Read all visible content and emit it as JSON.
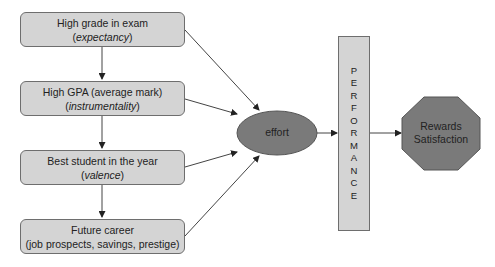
{
  "diagram": {
    "type": "flow",
    "boxes": [
      {
        "title": "High grade in exam",
        "subtitle_open": "(",
        "subtitle_italic": "expectancy",
        "subtitle_close": ")"
      },
      {
        "title": "High GPA (average mark)",
        "subtitle_open": "(",
        "subtitle_italic": "instrumentality",
        "subtitle_close": ")"
      },
      {
        "title": "Best student in the year",
        "subtitle_open": "(",
        "subtitle_italic": "valence",
        "subtitle_close": ")"
      },
      {
        "title": "Future career",
        "subtitle_plain": "(job prospects, savings, prestige)"
      }
    ],
    "effort": {
      "label": "effort"
    },
    "performance": {
      "letters": [
        "P",
        "E",
        "R",
        "F",
        "O",
        "R",
        "M",
        "A",
        "N",
        "C",
        "E"
      ]
    },
    "reward": {
      "line1": "Rewards",
      "line2": "Satisfaction"
    },
    "colors": {
      "box_fill": "#d4d4d4",
      "dark_fill": "#7a7a7a",
      "stroke": "#6e6e6e",
      "arrow": "#333333"
    },
    "edges": [
      [
        "box-0",
        "box-1"
      ],
      [
        "box-1",
        "box-2"
      ],
      [
        "box-2",
        "box-3"
      ],
      [
        "box-0",
        "effort"
      ],
      [
        "box-1",
        "effort"
      ],
      [
        "box-2",
        "effort"
      ],
      [
        "box-3",
        "effort"
      ],
      [
        "effort",
        "performance"
      ],
      [
        "performance",
        "reward"
      ]
    ]
  }
}
